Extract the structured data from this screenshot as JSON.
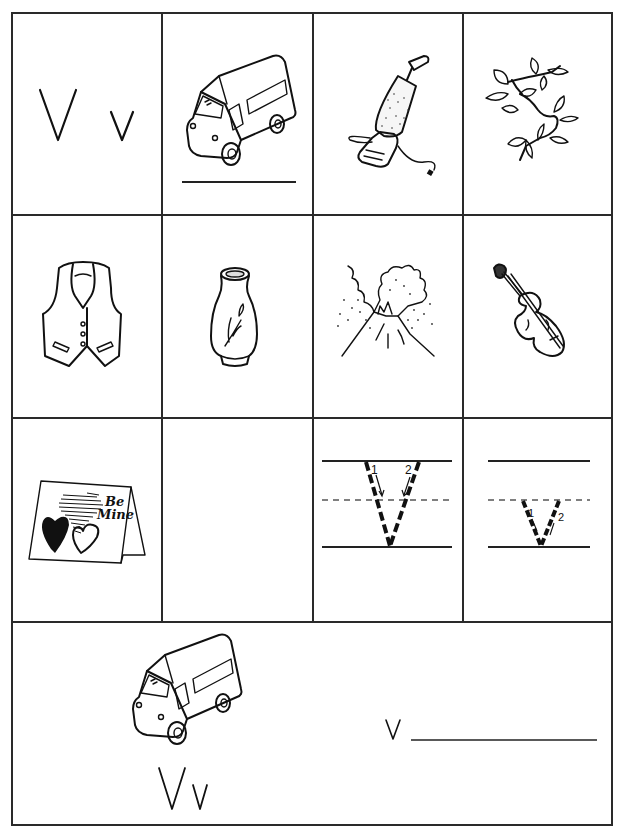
{
  "worksheet": {
    "letter_upper": "V",
    "letter_lower": "v",
    "grid": {
      "rows": [
        [
          {
            "type": "letters",
            "upper": "V",
            "lower": "v"
          },
          {
            "type": "picture",
            "label": "van",
            "icon": "van-icon",
            "has_write_line": true
          },
          {
            "type": "picture",
            "label": "vacuum",
            "icon": "vacuum-icon"
          },
          {
            "type": "picture",
            "label": "vine",
            "icon": "vine-icon"
          }
        ],
        [
          {
            "type": "picture",
            "label": "vest",
            "icon": "vest-icon"
          },
          {
            "type": "picture",
            "label": "vase",
            "icon": "vase-icon"
          },
          {
            "type": "picture",
            "label": "volcano",
            "icon": "volcano-icon"
          },
          {
            "type": "picture",
            "label": "violin",
            "icon": "violin-icon"
          }
        ],
        [
          {
            "type": "picture",
            "label": "valentine",
            "icon": "valentine-card-icon",
            "card_text_line1": "Be",
            "card_text_line2": "Mine"
          },
          {
            "type": "empty"
          },
          {
            "type": "tracing",
            "letter": "V",
            "stroke_numbers": [
              "1",
              "2"
            ]
          },
          {
            "type": "tracing",
            "letter": "v",
            "stroke_numbers": [
              "1",
              "2"
            ]
          }
        ]
      ]
    },
    "bottom_panel": {
      "picture_label": "van",
      "letters": "Vv",
      "prompt_letter": "v"
    }
  }
}
